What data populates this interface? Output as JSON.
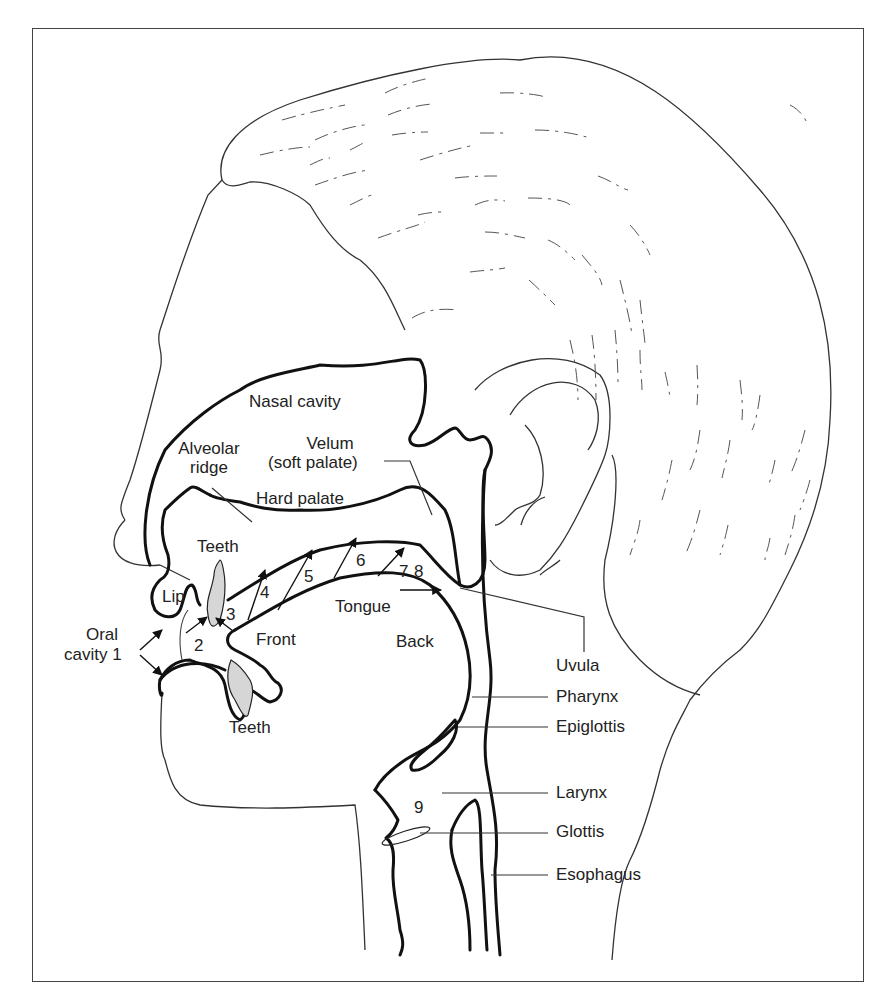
{
  "figure": {
    "colors": {
      "outline": "#111111",
      "thin_line": "#444444",
      "teeth_fill": "#d8d8d8",
      "border": "#444444",
      "background": "#ffffff"
    }
  },
  "labels": {
    "nasal_cavity": "Nasal cavity",
    "alveolar_ridge_1": "Alveolar",
    "alveolar_ridge_2": "ridge",
    "velum_1": "Velum",
    "velum_2": "(soft palate)",
    "hard_palate": "Hard palate",
    "teeth_upper": "Teeth",
    "teeth_lower": "Teeth",
    "lip": "Lip",
    "oral_cavity_1": "Oral",
    "oral_cavity_2": "cavity 1",
    "front": "Front",
    "tongue": "Tongue",
    "back": "Back",
    "uvula": "Uvula",
    "pharynx": "Pharynx",
    "epiglottis": "Epiglottis",
    "larynx": "Larynx",
    "glottis": "Glottis",
    "esophagus": "Esophagus"
  },
  "places_of_articulation": [
    "2",
    "3",
    "4",
    "5",
    "6",
    "7",
    "8",
    "9"
  ]
}
